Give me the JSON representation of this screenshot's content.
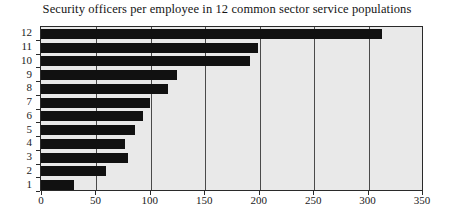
{
  "chart_data": {
    "type": "bar",
    "orientation": "horizontal",
    "title": "Security officers per employee in 12 common sector service populations",
    "xlabel": "",
    "ylabel": "",
    "categories": [
      "1",
      "2",
      "3",
      "4",
      "5",
      "6",
      "7",
      "8",
      "9",
      "10",
      "11",
      "12"
    ],
    "values": [
      30,
      60,
      80,
      77,
      86,
      94,
      100,
      117,
      125,
      192,
      199,
      313
    ],
    "xlim": [
      0,
      350
    ],
    "xticks": [
      0,
      50,
      100,
      150,
      200,
      250,
      300,
      350
    ],
    "xtick_labels": [
      "0",
      "50",
      "100",
      "150",
      "200",
      "250",
      "300",
      "350"
    ],
    "ytick_labels": [
      "12",
      "11",
      "10",
      "9",
      "8",
      "7",
      "6",
      "5",
      "4",
      "3",
      "2",
      "1"
    ],
    "grid": true,
    "grid_axis": "x",
    "legend": null,
    "bar_color": "#111111",
    "plot_background": "#e9e9e9",
    "figure_background": "#ffffff",
    "axis_color": "#2a2a2a"
  }
}
